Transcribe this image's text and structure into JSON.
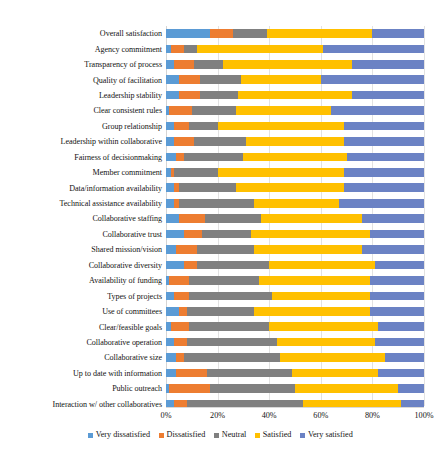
{
  "chart_data": {
    "type": "bar",
    "subtype": "stacked-horizontal-100-percent",
    "title": "",
    "xlabel": "",
    "ylabel": "",
    "xlim": [
      0,
      100
    ],
    "xticks": [
      "0%",
      "20%",
      "40%",
      "60%",
      "80%",
      "100%"
    ],
    "xtick_values": [
      0,
      20,
      40,
      60,
      80,
      100
    ],
    "grid": true,
    "grid_axis": "x",
    "legend_position": "bottom",
    "legend": [
      "Very dissatisfied",
      "Dissatisfied",
      "Neutral",
      "Satisfied",
      "Very satisfied"
    ],
    "colors": {
      "very_dissatisfied": "#5B9BD5",
      "dissatisfied": "#ED7D31",
      "neutral": "#808080",
      "satisfied": "#FFC000",
      "very_satisfied": "#6B82C4"
    },
    "categories": [
      "Overall satisfaction",
      "Agency commitment",
      "Transparency of process",
      "Quality of facilitation",
      "Leadership stability",
      "Clear consistent rules",
      "Group relationship",
      "Leadership within collaborative",
      "Fairness of decisionmaking",
      "Member commitment",
      "Data/information availability",
      "Technical assistance availability",
      "Collaborative staffing",
      "Collaborative trust",
      "Shared mission/vision",
      "Collaborative diversity",
      "Availability of funding",
      "Types of projects",
      "Use of committees",
      "Clear/feasible goals",
      "Collaborative operation",
      "Collaborative size",
      "Up to date with information",
      "Public outreach",
      "Interaction w/ other collaboratives"
    ],
    "series": [
      {
        "name": "Very dissatisfied",
        "color": "#5B9BD5",
        "values": [
          17,
          2,
          3,
          5,
          5,
          1,
          3,
          3,
          4,
          2,
          3,
          3,
          5,
          7,
          4,
          7,
          1,
          3,
          5,
          2,
          3,
          4,
          4,
          1,
          3
        ]
      },
      {
        "name": "Dissatisfied",
        "color": "#ED7D31",
        "values": [
          9,
          5,
          8,
          8,
          8,
          9,
          6,
          8,
          3,
          1,
          2,
          2,
          10,
          7,
          8,
          5,
          8,
          6,
          3,
          7,
          5,
          3,
          12,
          16,
          5
        ]
      },
      {
        "name": "Neutral",
        "color": "#808080",
        "values": [
          13,
          5,
          11,
          16,
          15,
          17,
          11,
          20,
          23,
          17,
          22,
          29,
          22,
          19,
          22,
          28,
          27,
          32,
          26,
          31,
          35,
          37,
          33,
          33,
          45
        ]
      },
      {
        "name": "Satisfied",
        "color": "#FFC000",
        "values": [
          41,
          49,
          50,
          31,
          44,
          37,
          49,
          38,
          40,
          49,
          42,
          33,
          39,
          46,
          42,
          41,
          43,
          38,
          45,
          42,
          38,
          41,
          33,
          40,
          38
        ]
      },
      {
        "name": "Very satisfied",
        "color": "#6B82C4",
        "values": [
          20,
          39,
          28,
          40,
          28,
          36,
          31,
          31,
          30,
          31,
          31,
          33,
          24,
          21,
          24,
          19,
          21,
          21,
          21,
          18,
          19,
          15,
          18,
          10,
          9
        ]
      }
    ]
  },
  "legend": {
    "items": [
      {
        "label": "Very dissatisfied",
        "color": "#5B9BD5"
      },
      {
        "label": "Dissatisfied",
        "color": "#ED7D31"
      },
      {
        "label": "Neutral",
        "color": "#808080"
      },
      {
        "label": "Satisfied",
        "color": "#FFC000"
      },
      {
        "label": "Very satisfied",
        "color": "#6B82C4"
      }
    ]
  },
  "axis": {
    "x_tick_labels": [
      "0%",
      "20%",
      "40%",
      "60%",
      "80%",
      "100%"
    ]
  }
}
